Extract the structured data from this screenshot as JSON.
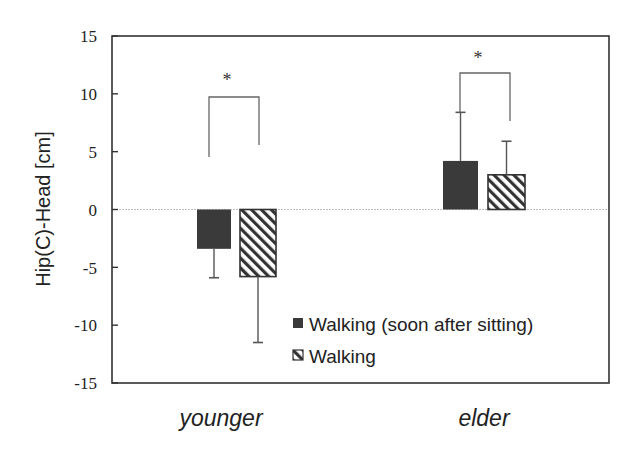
{
  "chart_data": {
    "type": "bar",
    "title": "",
    "xlabel": "",
    "ylabel": "Hip(C)-Head [cm]",
    "ylim": [
      -15,
      15
    ],
    "yticks": [
      15,
      10,
      5,
      0,
      -5,
      -10,
      -15
    ],
    "grid": false,
    "zero_line": true,
    "categories": [
      "younger",
      "elder"
    ],
    "series": [
      {
        "name": "Walking (soon after sitting)",
        "pattern": "solid",
        "color": "#3a3a3a",
        "values": [
          -3.4,
          4.2
        ],
        "errors": [
          2.5,
          4.2
        ]
      },
      {
        "name": "Walking",
        "pattern": "hatched",
        "color": "#333333",
        "values": [
          -5.8,
          3.0
        ],
        "errors": [
          5.7,
          2.9
        ]
      }
    ],
    "annotations": [
      {
        "category": "younger",
        "text": "*",
        "type": "significance-bracket"
      },
      {
        "category": "elder",
        "text": "*",
        "type": "significance-bracket"
      }
    ],
    "legend": {
      "position": "inside-lower-right",
      "entries": [
        "Walking (soon after sitting)",
        "Walking"
      ]
    }
  },
  "axis": {
    "ylabel": "Hip(C)-Head [cm]",
    "yticks": [
      "15",
      "10",
      "5",
      "0",
      "-5",
      "-10",
      "-15"
    ],
    "xcategories": [
      "younger",
      "elder"
    ]
  },
  "legend": {
    "items": [
      {
        "label": "Walking (soon after sitting)"
      },
      {
        "label": "Walking"
      }
    ]
  },
  "significance": {
    "younger": "*",
    "elder": "*"
  }
}
